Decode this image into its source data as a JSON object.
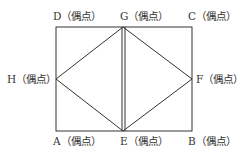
{
  "diagram": {
    "type": "graph",
    "vertices": [
      {
        "id": "A",
        "label": "A（偶点）",
        "x": 56,
        "y": 131
      },
      {
        "id": "B",
        "label": "B（偶点）",
        "x": 192,
        "y": 131
      },
      {
        "id": "C",
        "label": "C（偶点）",
        "x": 192,
        "y": 27
      },
      {
        "id": "D",
        "label": "D（偶点）",
        "x": 56,
        "y": 27
      },
      {
        "id": "E",
        "label": "E（偶点）",
        "x": 123,
        "y": 131
      },
      {
        "id": "F",
        "label": "F（偶点）",
        "x": 192,
        "y": 79
      },
      {
        "id": "G",
        "label": "G（偶点）",
        "x": 123,
        "y": 27
      },
      {
        "id": "H",
        "label": "H（偶点）",
        "x": 56,
        "y": 79
      }
    ],
    "edges": [
      [
        "A",
        "E"
      ],
      [
        "E",
        "B"
      ],
      [
        "B",
        "F"
      ],
      [
        "F",
        "C"
      ],
      [
        "C",
        "G"
      ],
      [
        "G",
        "D"
      ],
      [
        "D",
        "H"
      ],
      [
        "H",
        "A"
      ],
      [
        "H",
        "G"
      ],
      [
        "H",
        "E"
      ],
      [
        "G",
        "F"
      ],
      [
        "F",
        "E"
      ],
      [
        "G",
        "E"
      ],
      [
        "G",
        "E"
      ]
    ],
    "line_color": "#333333"
  }
}
